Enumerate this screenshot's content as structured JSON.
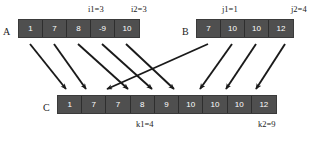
{
  "diagram": {
    "arrays": [
      {
        "id": "A",
        "label": "A",
        "values": [
          "1",
          "7",
          "8",
          "-9",
          "10"
        ],
        "markers": [
          {
            "name": "i1",
            "text": "i1=3"
          },
          {
            "name": "i2",
            "text": "i2=3"
          }
        ]
      },
      {
        "id": "B",
        "label": "B",
        "values": [
          "7",
          "10",
          "10",
          "12"
        ],
        "markers": [
          {
            "name": "j1",
            "text": "j1=1"
          },
          {
            "name": "j2",
            "text": "j2=4"
          }
        ]
      },
      {
        "id": "C",
        "label": "C",
        "values": [
          "1",
          "7",
          "7",
          "8",
          "9",
          "10",
          "10",
          "10",
          "12"
        ],
        "markers": [
          {
            "name": "k1",
            "text": "k1=4"
          },
          {
            "name": "k2",
            "text": "k2=9"
          }
        ]
      }
    ],
    "colors": {
      "cell_fill": "#4f4f4f",
      "cell_text": "#ffffff",
      "arrow": "#1a1a1a",
      "background": "#ffffff"
    }
  }
}
